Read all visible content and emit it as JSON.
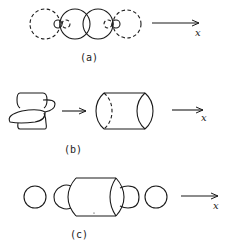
{
  "panels": [
    {
      "id": "a",
      "label": "(a)",
      "axis_label": "x",
      "description": "Two overlapping solid circles with small lobes on each side and dashed outer circles"
    },
    {
      "id": "b",
      "label": "(b)",
      "axis_label": "x",
      "description": "Overlapping lobed shape transforms into a cylinder"
    },
    {
      "id": "c",
      "label": "(c)",
      "axis_label": "x",
      "description": "Cylinder flanked by partial circles and outer circles"
    }
  ],
  "colors": {
    "line": "#1a1a1a",
    "background": "#ffffff"
  }
}
